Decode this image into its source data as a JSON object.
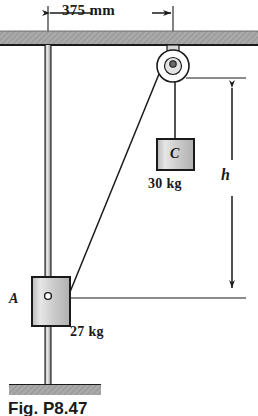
{
  "figure": {
    "caption": "Fig. P8.47"
  },
  "dimensions": {
    "horizontal": {
      "label": "375 mm",
      "from": "vertical-rod",
      "to": "pulley-center"
    },
    "vertical": {
      "label": "h",
      "from": "pulley-level",
      "to": "collar-A-level"
    }
  },
  "bodies": {
    "collar_a": {
      "label": "A",
      "mass": "27 kg"
    },
    "block_c": {
      "label": "C",
      "mass": "30 kg"
    }
  },
  "elements": {
    "ceiling": "hatched-support-beam",
    "floor": "hatched-ground-base",
    "pulley": "pulley-wheel",
    "rod": "vertical-guide-rod",
    "cable_diagonal": "cable-pulley-to-collar",
    "cable_vertical": "cable-pulley-to-block"
  },
  "colors": {
    "line": "#1a1a1a",
    "hatch_fill": "#a8a8a8",
    "block_fill": "#c8c8c8",
    "rod_fill": "#b4b4b4"
  }
}
